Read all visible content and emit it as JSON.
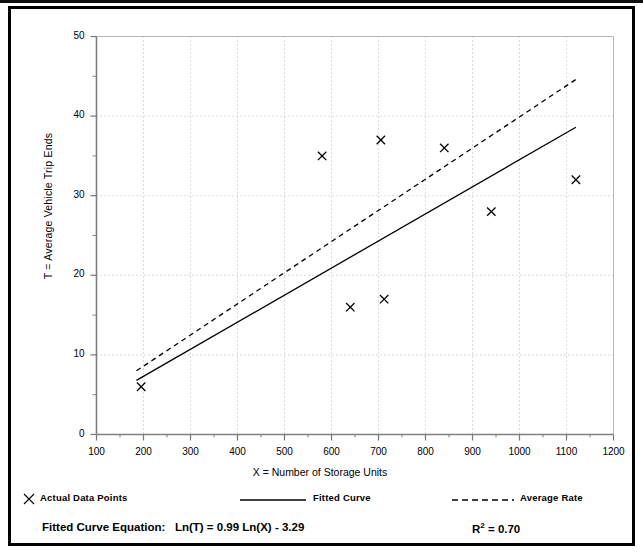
{
  "figure": {
    "background": "#ffffff",
    "border_color": "#000000"
  },
  "axes": {
    "y_title": "T = Average Vehicle Trip Ends",
    "x_title": "X = Number of Storage Units",
    "y_ticks": [
      "0",
      "10",
      "20",
      "30",
      "40",
      "50"
    ],
    "x_ticks": [
      "100",
      "200",
      "300",
      "400",
      "500",
      "600",
      "700",
      "800",
      "900",
      "1000",
      "1100",
      "1200"
    ]
  },
  "legend": {
    "items": [
      {
        "label": "Actual Data Points",
        "marker": "cross-marker",
        "color": "#000000"
      },
      {
        "label": "Fitted Curve",
        "marker": "solid-line",
        "color": "#000000"
      },
      {
        "label": "Average Rate",
        "marker": "dashed-line",
        "color": "#000000"
      }
    ]
  },
  "annotations": {
    "equation_label": "Fitted Curve Equation:",
    "equation": "Ln(T) = 0.99 Ln(X) - 3.29",
    "r_squared_symbol": "R",
    "r_squared_exponent": "2",
    "r_squared_value": "= 0.70"
  },
  "chart_data": {
    "type": "scatter",
    "title": "",
    "xlabel": "X = Number of Storage Units",
    "ylabel": "T = Average Vehicle Trip Ends",
    "xlim": [
      100,
      1200
    ],
    "ylim": [
      0,
      50
    ],
    "x_major_step": 100,
    "y_major_step": 10,
    "y_minor_step": 5,
    "grid": true,
    "grid_style": "dotted",
    "legend_position": "below-axes",
    "series": [
      {
        "name": "Actual Data Points",
        "type": "scatter",
        "marker": "x",
        "color": "#000000",
        "points": [
          {
            "x": 195,
            "y": 6
          },
          {
            "x": 580,
            "y": 35
          },
          {
            "x": 640,
            "y": 16
          },
          {
            "x": 705,
            "y": 37
          },
          {
            "x": 712,
            "y": 17
          },
          {
            "x": 840,
            "y": 36
          },
          {
            "x": 940,
            "y": 28
          },
          {
            "x": 1120,
            "y": 32
          }
        ]
      },
      {
        "name": "Fitted Curve",
        "type": "line",
        "style": "solid",
        "color": "#000000",
        "equation": "Ln(T) = 0.99 Ln(X) - 3.29",
        "r_squared": 0.7,
        "points": [
          {
            "x": 185,
            "y": 6.8
          },
          {
            "x": 1120,
            "y": 38.6
          }
        ]
      },
      {
        "name": "Average Rate",
        "type": "line",
        "style": "dashed",
        "color": "#000000",
        "points": [
          {
            "x": 185,
            "y": 8.0
          },
          {
            "x": 1120,
            "y": 44.6
          }
        ]
      }
    ]
  }
}
